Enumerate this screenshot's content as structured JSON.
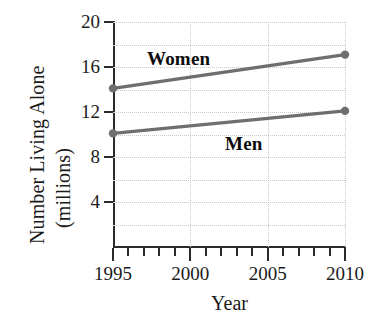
{
  "chart_data": {
    "type": "line",
    "title": "",
    "xlabel": "Year",
    "ylabel": "Number Living Alone (millions)",
    "ylabel_line1": "Number Living Alone",
    "ylabel_line2": "(millions)",
    "x": [
      1995,
      2010
    ],
    "xlim": [
      1995,
      2010
    ],
    "ylim": [
      0,
      20
    ],
    "grid": true,
    "legend_position": "inline-annotations",
    "xticks_major": [
      1995,
      2000,
      2005,
      2010
    ],
    "xtick_labels": [
      "1995",
      "2000",
      "2005",
      "2010"
    ],
    "xticks_minor": [
      1996,
      1997,
      1998,
      1999,
      2001,
      2002,
      2003,
      2004,
      2006,
      2007,
      2008,
      2009
    ],
    "yticks": [
      4,
      8,
      12,
      16,
      20
    ],
    "ytick_labels": [
      "4",
      "8",
      "12",
      "16",
      "20"
    ],
    "ygridlines": [
      2,
      4,
      6,
      8,
      10,
      12,
      14,
      16,
      18,
      20
    ],
    "vgridlines": [
      2000,
      2005,
      2010
    ],
    "series": [
      {
        "name": "Women",
        "values": [
          14.1,
          17.1
        ],
        "color": "#6e6e6e",
        "marker": "circle"
      },
      {
        "name": "Men",
        "values": [
          10.1,
          12.1
        ],
        "color": "#6e6e6e",
        "marker": "circle"
      }
    ],
    "annotations": [
      {
        "text": "Women",
        "x": 1999,
        "y": 18.2
      },
      {
        "text": "Men",
        "x": 2004,
        "y": 10.6
      }
    ]
  },
  "colors": {
    "line": "#6e6e6e",
    "axis": "#2b2b2b",
    "grid": "#c9c9c9",
    "text": "#1b1b1b",
    "background": "#ffffff"
  }
}
